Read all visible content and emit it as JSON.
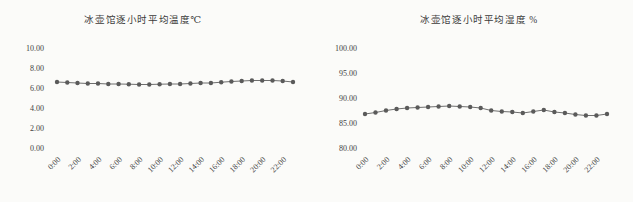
{
  "colors": {
    "background": "#fbfbf9",
    "marker": "#5a5a5a",
    "line": "#6e6e6e",
    "title_text": "#3a3a3a",
    "tick_text": "#424242"
  },
  "chart_data": [
    {
      "type": "line",
      "title": "冰壶馆逐小时平均温度℃",
      "xlabel": "",
      "ylabel": "",
      "legend": false,
      "grid": false,
      "marker": "circle",
      "ylim": [
        0,
        10
      ],
      "yticks": [
        0,
        2,
        4,
        6,
        8,
        10
      ],
      "ytick_labels": [
        "0.00",
        "2.00",
        "4.00",
        "6.00",
        "8.00",
        "10.00"
      ],
      "x_hours": [
        0,
        1,
        2,
        3,
        4,
        5,
        6,
        7,
        8,
        9,
        10,
        11,
        12,
        13,
        14,
        15,
        16,
        17,
        18,
        19,
        20,
        21,
        22,
        23
      ],
      "x_tick_hours": [
        0,
        2,
        4,
        6,
        8,
        10,
        12,
        14,
        16,
        18,
        20,
        22
      ],
      "x_tick_labels": [
        "0:00",
        "2:00",
        "4:00",
        "6:00",
        "8:00",
        "10:00",
        "12:00",
        "14:00",
        "16:00",
        "18:00",
        "20:00",
        "22:00"
      ],
      "values": [
        6.6,
        6.55,
        6.5,
        6.45,
        6.45,
        6.4,
        6.4,
        6.38,
        6.35,
        6.35,
        6.38,
        6.4,
        6.4,
        6.45,
        6.5,
        6.5,
        6.58,
        6.65,
        6.7,
        6.75,
        6.75,
        6.75,
        6.7,
        6.6
      ]
    },
    {
      "type": "line",
      "title": "冰壶馆逐小时平均湿度 %",
      "xlabel": "",
      "ylabel": "",
      "legend": false,
      "grid": false,
      "marker": "circle",
      "ylim": [
        80,
        100
      ],
      "yticks": [
        80,
        85,
        90,
        95,
        100
      ],
      "ytick_labels": [
        "80.00",
        "85.00",
        "90.00",
        "95.00",
        "100.00"
      ],
      "x_hours": [
        0,
        1,
        2,
        3,
        4,
        5,
        6,
        7,
        8,
        9,
        10,
        11,
        12,
        13,
        14,
        15,
        16,
        17,
        18,
        19,
        20,
        21,
        22,
        23
      ],
      "x_tick_hours": [
        0,
        2,
        4,
        6,
        8,
        10,
        12,
        14,
        16,
        18,
        20,
        22
      ],
      "x_tick_labels": [
        "0:00",
        "2:00",
        "4:00",
        "6:00",
        "8:00",
        "10:00",
        "12:00",
        "14:00",
        "16:00",
        "18:00",
        "20:00",
        "22:00"
      ],
      "values": [
        86.8,
        87.1,
        87.5,
        87.8,
        88.0,
        88.1,
        88.2,
        88.3,
        88.4,
        88.3,
        88.2,
        88.0,
        87.5,
        87.3,
        87.2,
        87.0,
        87.3,
        87.6,
        87.2,
        87.0,
        86.7,
        86.5,
        86.5,
        86.8
      ]
    }
  ]
}
